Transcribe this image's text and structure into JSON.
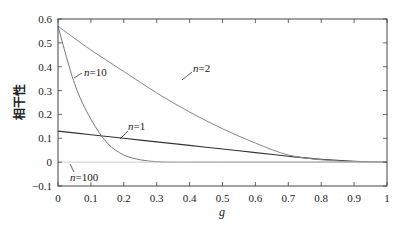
{
  "chart_data": {
    "type": "line",
    "title": "",
    "xlabel": "g",
    "ylabel": "相干性",
    "xlim": [
      0,
      1
    ],
    "ylim": [
      -0.1,
      0.6
    ],
    "xticks": [
      0,
      0.1,
      0.2,
      0.3,
      0.4,
      0.5,
      0.6,
      0.7,
      0.8,
      0.9,
      1
    ],
    "xtick_labels": [
      "0",
      "0.1",
      "0.2",
      "0.3",
      "0.4",
      "0.5",
      "0.6",
      "0.7",
      "0.8",
      "0.9",
      "1"
    ],
    "yticks": [
      -0.1,
      0,
      0.1,
      0.2,
      0.3,
      0.4,
      0.5,
      0.6
    ],
    "ytick_labels": [
      "−0.1",
      "0",
      "0.1",
      "0.2",
      "0.3",
      "0.4",
      "0.5",
      "0.6"
    ],
    "grid": false,
    "legend": "inline annotations",
    "series": [
      {
        "name": "n=1",
        "color": "#333333",
        "x": [
          0,
          0.1,
          0.2,
          0.3,
          0.4,
          0.5,
          0.6,
          0.7,
          0.8,
          0.9,
          1.0
        ],
        "y": [
          0.13,
          0.115,
          0.1,
          0.085,
          0.07,
          0.055,
          0.04,
          0.025,
          0.012,
          0.004,
          0.0
        ]
      },
      {
        "name": "n=2",
        "color": "#888888",
        "x": [
          0,
          0.1,
          0.2,
          0.3,
          0.4,
          0.5,
          0.6,
          0.7,
          0.8,
          0.9,
          1.0
        ],
        "y": [
          0.57,
          0.47,
          0.38,
          0.29,
          0.21,
          0.14,
          0.08,
          0.03,
          0.01,
          0.002,
          0.0
        ]
      },
      {
        "name": "n=10",
        "color": "#777777",
        "x": [
          0,
          0.05,
          0.1,
          0.15,
          0.2,
          0.25,
          0.3,
          0.35,
          0.4,
          0.5,
          0.6,
          0.7,
          0.8,
          0.9,
          1.0
        ],
        "y": [
          0.57,
          0.33,
          0.18,
          0.08,
          0.03,
          0.01,
          0.002,
          0.0,
          0.0,
          0.0,
          0.0,
          0.0,
          0.0,
          0.0,
          0.0
        ]
      },
      {
        "name": "n=100",
        "color": "#cccccc",
        "x": [
          0,
          1.0
        ],
        "y": [
          0.0,
          0.0
        ]
      }
    ],
    "annotations": [
      {
        "text": "n=2",
        "x": 0.35,
        "y": 0.38
      },
      {
        "text": "n=10",
        "x": 0.1,
        "y": 0.33
      },
      {
        "text": "n=1",
        "x": 0.32,
        "y": 0.15
      },
      {
        "text": "n=100",
        "x": 0.07,
        "y": -0.06
      }
    ]
  },
  "labels": {
    "xlabel": "g",
    "ylabel": "相干性",
    "n1": "n=1",
    "n2": "n=2",
    "n10": "n=10",
    "n100": "n=100"
  }
}
